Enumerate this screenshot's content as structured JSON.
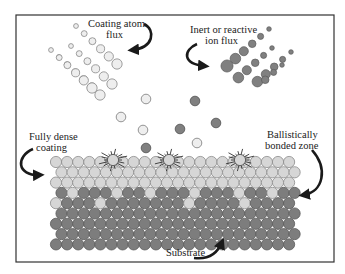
{
  "diagram": {
    "labels": {
      "coating_flux_line1": "Coating atom",
      "coating_flux_line2": "flux",
      "ion_flux_line1": "Inert or reactive",
      "ion_flux_line2": "ion flux",
      "dense_line1": "Fully dense",
      "dense_line2": "coating",
      "ballistic_line1": "Ballistically",
      "ballistic_line2": "bonded zone",
      "substrate": "Substrate"
    },
    "colors": {
      "frame": "#333333",
      "light_atom_fill": "#d6d6d6",
      "light_atom_stroke": "#8a8a8a",
      "dark_atom_fill": "#7d7d7d",
      "dark_atom_stroke": "#5a5a5a",
      "flux_coating_fill": "#eeeeee",
      "flux_ion_fill": "#808080",
      "arrow": "#1a1a1a",
      "burst": "#333333"
    },
    "lattice": {
      "rows": [
        "LLLLLLLLLLLLLLLLLLLLLL",
        "LLLLLLLLLLLLLLLLLLLLLL",
        "LLLLLLLLLLLLLLLLLLLLLL",
        "DLDDDLDDLDDDLDDDLDDLDD",
        "LDDDLDDDDDDDLDDDDLDDDD",
        "DDDDDDDDDDDDDDDDDDDDDD",
        "DDDDDDDDDDDDDDDDDDDDDD",
        "DDDDDDDDDDDDDDDDDDDDDD",
        "DDDDDDDDDDDDDDDDDDDDDD"
      ]
    },
    "impacts": [
      {
        "x": 113,
        "y": 160
      },
      {
        "x": 169,
        "y": 160
      },
      {
        "x": 240,
        "y": 160
      }
    ]
  }
}
